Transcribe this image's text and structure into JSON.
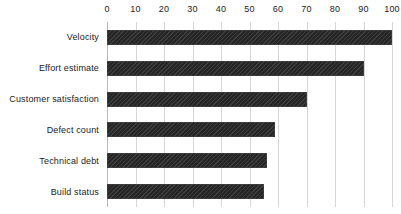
{
  "chart_data": {
    "type": "bar",
    "orientation": "horizontal",
    "title": "",
    "subtitle": "",
    "xlabel": "",
    "ylabel": "",
    "categories": [
      "Velocity",
      "Effort estimate",
      "Customer satisfaction",
      "Defect count",
      "Technical debt",
      "Build status"
    ],
    "values": [
      100,
      90,
      70,
      59,
      56,
      55
    ],
    "xlim": [
      0,
      100
    ],
    "xticks": [
      0,
      10,
      20,
      30,
      40,
      50,
      60,
      70,
      80,
      90,
      100
    ],
    "xtick_labels": [
      "0",
      "10",
      "20",
      "30",
      "40",
      "50",
      "60",
      "70",
      "80",
      "90",
      "100"
    ],
    "grid": "vertical",
    "legend": false,
    "legend_position": "none",
    "series": [
      {
        "name": "",
        "values": [
          100,
          90,
          70,
          59,
          56,
          55
        ]
      }
    ],
    "colors": {
      "bar_fill": "#262626",
      "bar_edge": "#4a4a4a",
      "gridline": "#d6d6d6",
      "axis_line": "#b9b9b9",
      "text": "#1c1c1c",
      "background": "#ffffff"
    }
  }
}
